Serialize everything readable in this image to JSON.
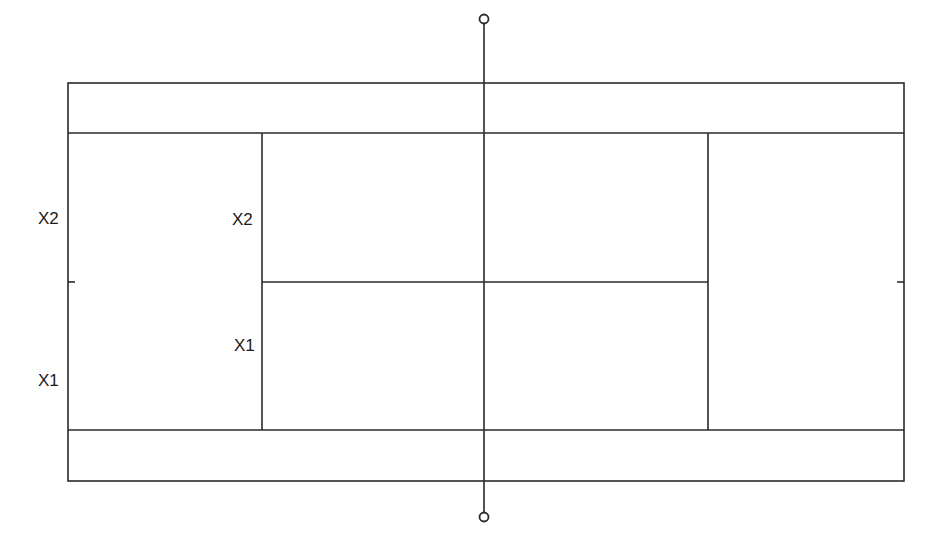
{
  "diagram": {
    "type": "tennis-court-top-view",
    "line_color": "#2a2a2a",
    "labels": {
      "left_outer_upper": "X2",
      "left_outer_lower": "X1",
      "left_inner_upper": "X2",
      "left_inner_lower": "X1"
    },
    "elements": [
      "outer-court-boundary",
      "upper-doubles-sideline",
      "lower-singles-sideline",
      "left-service-line",
      "right-service-line",
      "center-service-line",
      "net-line",
      "net-post-top",
      "net-post-bottom",
      "left-center-mark",
      "right-center-mark"
    ]
  }
}
